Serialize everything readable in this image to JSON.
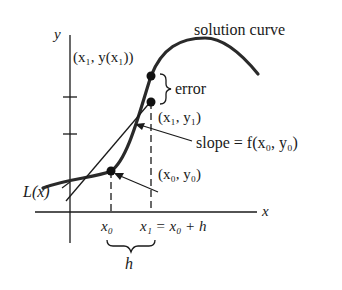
{
  "diagram": {
    "labels": {
      "y_axis": "y",
      "x_axis": "x",
      "solution_curve": "solution curve",
      "true_point": "(x₁, y(x₁))",
      "error": "error",
      "approx_point": "(x₁, y₁)",
      "slope": "slope = f(x₀, y₀)",
      "initial_point": "(x₀, y₀)",
      "tangent_line": "L(x)",
      "x0_tick": "x₀",
      "x1_tick": "x₁ = x₀ + h",
      "step": "h"
    },
    "colors": {
      "ink": "#1a1a1a",
      "curve": "#2a2a2a",
      "background": "#ffffff"
    }
  }
}
